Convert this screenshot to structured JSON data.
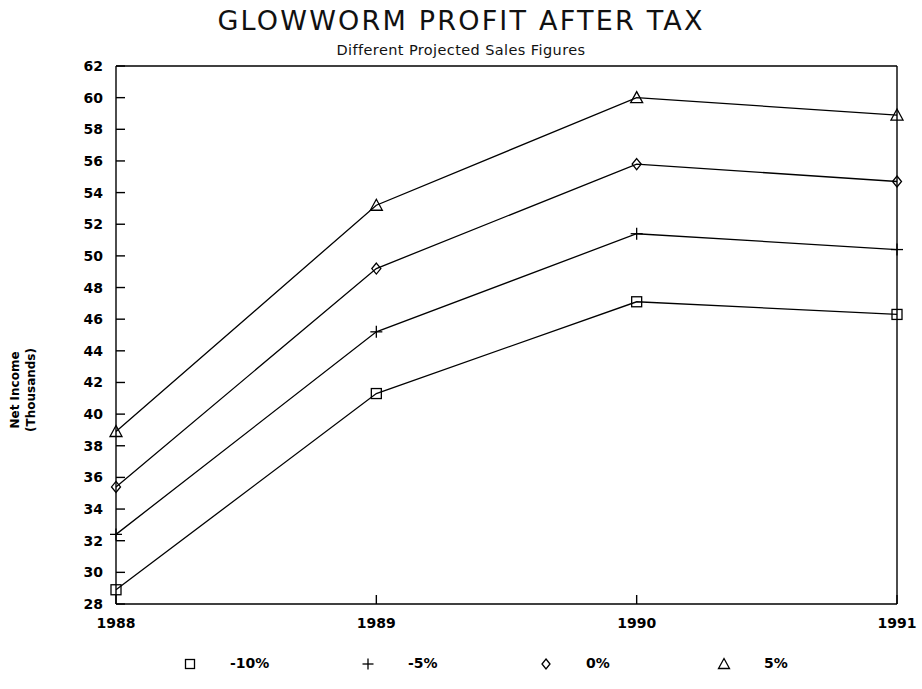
{
  "chart_data": {
    "type": "line",
    "title": "GLOWWORM PROFIT AFTER TAX",
    "subtitle": "Different Projected Sales Figures",
    "xlabel": "",
    "ylabel": "Net Income\n(Thousands)",
    "ylabel_line1": "Net Income",
    "ylabel_line2": "(Thousands)",
    "categories": [
      "1988",
      "1989",
      "1990",
      "1991"
    ],
    "x": [
      1988,
      1989,
      1990,
      1991
    ],
    "ylim": [
      28,
      62
    ],
    "ytick_step": 2,
    "yticks": [
      28,
      30,
      32,
      34,
      36,
      38,
      40,
      42,
      44,
      46,
      48,
      50,
      52,
      54,
      56,
      58,
      60,
      62
    ],
    "grid": false,
    "legend_position": "bottom",
    "series": [
      {
        "name": "-10%",
        "marker": "square",
        "values": [
          28.9,
          41.3,
          47.1,
          46.3
        ]
      },
      {
        "name": "-5%",
        "marker": "plus",
        "values": [
          32.4,
          45.2,
          51.4,
          50.4
        ]
      },
      {
        "name": "0%",
        "marker": "diamond",
        "values": [
          35.4,
          49.2,
          55.8,
          54.7
        ]
      },
      {
        "name": "5%",
        "marker": "triangle",
        "values": [
          38.9,
          53.2,
          60.0,
          58.9
        ]
      }
    ]
  },
  "legend": {
    "items": [
      {
        "marker": "square",
        "label": "-10%"
      },
      {
        "marker": "plus",
        "label": "-5%"
      },
      {
        "marker": "diamond",
        "label": "0%"
      },
      {
        "marker": "triangle",
        "label": "5%"
      }
    ]
  },
  "colors": {
    "ink": "#000000",
    "background": "#ffffff"
  }
}
